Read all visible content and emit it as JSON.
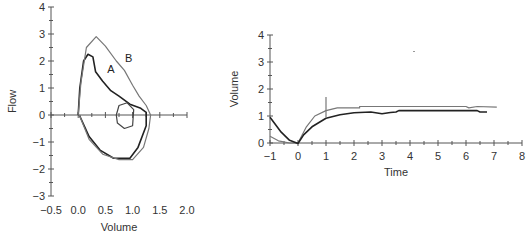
{
  "chart_data": [
    {
      "type": "line",
      "title": "",
      "xlabel": "Volume",
      "ylabel": "Flow",
      "xlim": [
        -0.5,
        2.0
      ],
      "ylim": [
        -3,
        4
      ],
      "xticks": [
        "−0.5",
        "0.0",
        "0.5",
        "1.0",
        "1.5",
        "2.0"
      ],
      "yticks": [
        "−3",
        "−2",
        "−1",
        "0",
        "1",
        "2",
        "3",
        "4"
      ],
      "grid": false,
      "annotations": [
        {
          "text": "A",
          "x": 0.6,
          "y": 1.55
        },
        {
          "text": "B",
          "x": 0.93,
          "y": 1.95
        }
      ],
      "series": [
        {
          "name": "A",
          "color": "#222222",
          "points": [
            [
              0.0,
              0.0
            ],
            [
              0.03,
              1.0
            ],
            [
              0.1,
              2.0
            ],
            [
              0.18,
              2.25
            ],
            [
              0.27,
              2.15
            ],
            [
              0.32,
              1.6
            ],
            [
              0.45,
              1.25
            ],
            [
              0.6,
              0.9
            ],
            [
              0.75,
              0.7
            ],
            [
              0.95,
              0.4
            ],
            [
              1.15,
              0.25
            ],
            [
              1.25,
              0.1
            ],
            [
              1.25,
              -0.4
            ],
            [
              1.1,
              -1.2
            ],
            [
              0.95,
              -1.6
            ],
            [
              0.65,
              -1.6
            ],
            [
              0.4,
              -1.3
            ],
            [
              0.2,
              -0.8
            ],
            [
              0.02,
              0.0
            ]
          ]
        },
        {
          "name": "B",
          "color": "#777777",
          "points": [
            [
              0.0,
              0.0
            ],
            [
              0.05,
              1.2
            ],
            [
              0.15,
              2.5
            ],
            [
              0.33,
              2.9
            ],
            [
              0.5,
              2.55
            ],
            [
              0.7,
              2.0
            ],
            [
              0.85,
              1.65
            ],
            [
              1.0,
              1.1
            ],
            [
              1.12,
              0.7
            ],
            [
              1.25,
              0.35
            ],
            [
              1.33,
              0.0
            ],
            [
              1.3,
              -0.5
            ],
            [
              1.2,
              -1.2
            ],
            [
              1.0,
              -1.65
            ],
            [
              0.75,
              -1.65
            ],
            [
              0.45,
              -1.45
            ],
            [
              0.2,
              -0.9
            ],
            [
              0.02,
              0.0
            ]
          ]
        },
        {
          "name": "inner-loop",
          "color": "#444444",
          "points": [
            [
              0.7,
              0.0
            ],
            [
              0.75,
              0.35
            ],
            [
              0.9,
              0.45
            ],
            [
              1.02,
              0.2
            ],
            [
              1.0,
              -0.4
            ],
            [
              0.85,
              -0.5
            ],
            [
              0.72,
              -0.3
            ],
            [
              0.7,
              0.0
            ]
          ]
        }
      ]
    },
    {
      "type": "line",
      "title": "",
      "xlabel": "Time",
      "ylabel": "Volume",
      "xlim": [
        -1,
        8
      ],
      "ylim": [
        0,
        4
      ],
      "xticks": [
        "−1",
        "0",
        "1",
        "2",
        "3",
        "4",
        "5",
        "6",
        "7",
        "8"
      ],
      "yticks": [
        "0",
        "1",
        "2",
        "3",
        "4"
      ],
      "grid": false,
      "series": [
        {
          "name": "gray",
          "color": "#777777",
          "points": [
            [
              -1,
              0.25
            ],
            [
              -0.7,
              0.08
            ],
            [
              -0.3,
              0.0
            ],
            [
              0,
              0.0
            ],
            [
              0.3,
              0.6
            ],
            [
              0.6,
              1.0
            ],
            [
              1.0,
              1.2
            ],
            [
              1.4,
              1.3
            ],
            [
              2.2,
              1.3
            ],
            [
              2.2,
              1.35
            ],
            [
              6.0,
              1.35
            ],
            [
              6.1,
              1.3
            ],
            [
              6.4,
              1.35
            ],
            [
              7.1,
              1.33
            ]
          ]
        },
        {
          "name": "black",
          "color": "#222222",
          "points": [
            [
              -1,
              0.95
            ],
            [
              -0.6,
              0.4
            ],
            [
              -0.3,
              0.1
            ],
            [
              0,
              -0.02
            ],
            [
              0.2,
              0.3
            ],
            [
              0.5,
              0.6
            ],
            [
              1.0,
              0.92
            ],
            [
              1.5,
              1.05
            ],
            [
              2.0,
              1.12
            ],
            [
              2.6,
              1.15
            ],
            [
              3.0,
              1.08
            ],
            [
              3.3,
              1.13
            ],
            [
              3.5,
              1.15
            ],
            [
              3.6,
              1.2
            ],
            [
              6.4,
              1.2
            ],
            [
              6.5,
              1.15
            ],
            [
              6.75,
              1.15
            ]
          ]
        }
      ],
      "markers": [
        {
          "type": "vertical-line",
          "x": 1.0,
          "y_from": 0.95,
          "y_to": 1.7
        }
      ]
    }
  ]
}
